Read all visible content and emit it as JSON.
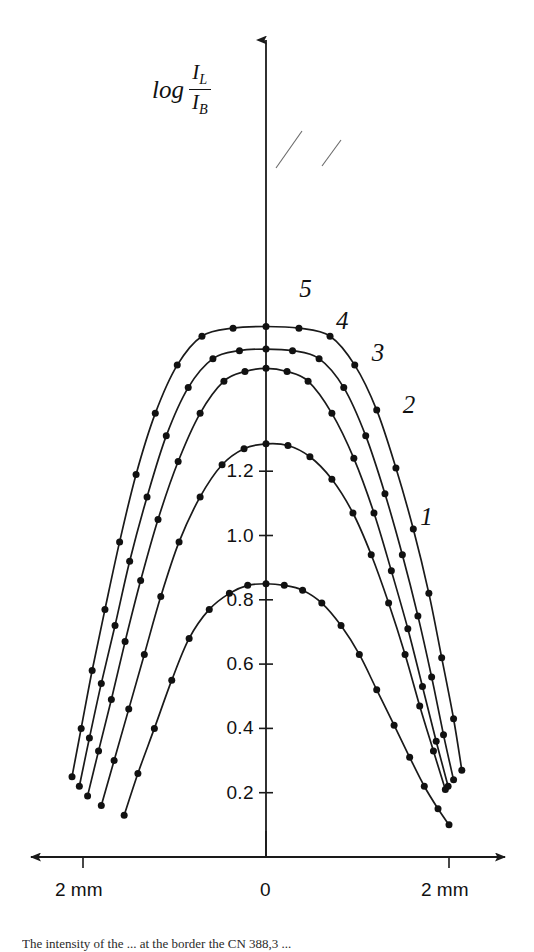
{
  "figure": {
    "caption": "The intensity of the ... at the border the CN 388,3 ..."
  },
  "axes": {
    "y_label": {
      "prefix": "log",
      "numerator": "I",
      "numerator_sub": "L",
      "denominator": "I",
      "denominator_sub": "B"
    },
    "y_ticks": [
      "1.2",
      "1.0",
      "0.8",
      "0.6",
      "0.4",
      "0.2"
    ],
    "x_ticks": [
      "2 mm",
      "0",
      "2 mm"
    ]
  },
  "curve_labels": [
    "5",
    "4",
    "3",
    "2",
    "1"
  ],
  "chart_data": {
    "type": "scatter",
    "title": "",
    "xlabel": "",
    "ylabel": "log I_L / I_B",
    "xlim": [
      -2.6,
      2.6
    ],
    "ylim": [
      0.0,
      1.8
    ],
    "x_tick_values": [
      -2,
      0,
      2
    ],
    "x_tick_labels": [
      "2 mm",
      "0",
      "2 mm"
    ],
    "y_tick_values": [
      1.2,
      1.0,
      0.8,
      0.6,
      0.4,
      0.2
    ],
    "y_tick_labels": [
      "1.2",
      "1.0",
      "0.8",
      "0.6",
      "0.4",
      "0.2"
    ],
    "grid": false,
    "legend": "inline-curve-numbers",
    "axis_style": "arrows",
    "series": [
      {
        "name": "1",
        "label_position": [
          1.75,
          1.05
        ],
        "x": [
          -1.55,
          -1.4,
          -1.22,
          -1.03,
          -0.84,
          -0.62,
          -0.4,
          -0.2,
          0.0,
          0.2,
          0.4,
          0.61,
          0.82,
          1.02,
          1.21,
          1.4,
          1.57,
          1.73,
          1.88,
          2.0
        ],
        "y": [
          0.13,
          0.26,
          0.4,
          0.55,
          0.68,
          0.77,
          0.82,
          0.845,
          0.85,
          0.845,
          0.83,
          0.79,
          0.72,
          0.63,
          0.52,
          0.41,
          0.31,
          0.22,
          0.15,
          0.1
        ]
      },
      {
        "name": "2",
        "label_position": [
          1.56,
          1.4
        ],
        "x": [
          -1.8,
          -1.66,
          -1.5,
          -1.33,
          -1.15,
          -0.95,
          -0.72,
          -0.48,
          -0.24,
          0.0,
          0.24,
          0.48,
          0.72,
          0.95,
          1.15,
          1.34,
          1.52,
          1.68,
          1.83,
          1.96
        ],
        "y": [
          0.16,
          0.3,
          0.46,
          0.63,
          0.81,
          0.98,
          1.12,
          1.22,
          1.27,
          1.285,
          1.28,
          1.245,
          1.175,
          1.07,
          0.94,
          0.79,
          0.63,
          0.47,
          0.33,
          0.21
        ]
      },
      {
        "name": "3",
        "label_position": [
          1.22,
          1.56
        ],
        "x": [
          -1.95,
          -1.83,
          -1.69,
          -1.54,
          -1.37,
          -1.18,
          -0.96,
          -0.72,
          -0.46,
          -0.23,
          0.0,
          0.23,
          0.46,
          0.72,
          0.96,
          1.18,
          1.37,
          1.55,
          1.71,
          1.86,
          1.99
        ],
        "y": [
          0.19,
          0.33,
          0.49,
          0.67,
          0.86,
          1.05,
          1.23,
          1.38,
          1.48,
          1.51,
          1.52,
          1.51,
          1.48,
          1.38,
          1.24,
          1.07,
          0.89,
          0.71,
          0.53,
          0.36,
          0.22
        ]
      },
      {
        "name": "4",
        "label_position": [
          0.83,
          1.66
        ],
        "x": [
          -2.04,
          -1.93,
          -1.8,
          -1.65,
          -1.49,
          -1.3,
          -1.09,
          -0.85,
          -0.58,
          -0.29,
          0.0,
          0.29,
          0.58,
          0.85,
          1.09,
          1.3,
          1.49,
          1.66,
          1.81,
          1.94,
          2.05
        ],
        "y": [
          0.22,
          0.37,
          0.54,
          0.72,
          0.92,
          1.12,
          1.31,
          1.46,
          1.55,
          1.575,
          1.58,
          1.575,
          1.55,
          1.46,
          1.31,
          1.13,
          0.94,
          0.75,
          0.56,
          0.38,
          0.24
        ]
      },
      {
        "name": "5",
        "label_position": [
          0.43,
          1.76
        ],
        "x": [
          -2.12,
          -2.02,
          -1.9,
          -1.76,
          -1.6,
          -1.42,
          -1.21,
          -0.97,
          -0.7,
          -0.36,
          0.0,
          0.36,
          0.7,
          0.97,
          1.21,
          1.42,
          1.61,
          1.78,
          1.92,
          2.05,
          2.14
        ],
        "y": [
          0.25,
          0.4,
          0.58,
          0.77,
          0.98,
          1.19,
          1.38,
          1.53,
          1.62,
          1.645,
          1.65,
          1.645,
          1.62,
          1.53,
          1.39,
          1.21,
          1.02,
          0.82,
          0.62,
          0.43,
          0.27
        ]
      }
    ]
  }
}
